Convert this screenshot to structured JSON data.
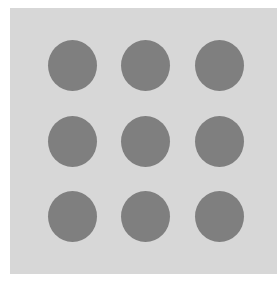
{
  "panel": {
    "background_color": "#d7d7d7",
    "rows": 3,
    "columns": 3
  },
  "dots": {
    "color": "#7f7f7f",
    "items": [
      {
        "row": 1,
        "col": 1,
        "x": 38,
        "y": 32
      },
      {
        "row": 1,
        "col": 2,
        "x": 111,
        "y": 32
      },
      {
        "row": 1,
        "col": 3,
        "x": 185,
        "y": 32
      },
      {
        "row": 2,
        "col": 1,
        "x": 38,
        "y": 108
      },
      {
        "row": 2,
        "col": 2,
        "x": 111,
        "y": 108
      },
      {
        "row": 2,
        "col": 3,
        "x": 185,
        "y": 108
      },
      {
        "row": 3,
        "col": 1,
        "x": 38,
        "y": 183
      },
      {
        "row": 3,
        "col": 2,
        "x": 111,
        "y": 183
      },
      {
        "row": 3,
        "col": 3,
        "x": 185,
        "y": 183
      }
    ]
  }
}
